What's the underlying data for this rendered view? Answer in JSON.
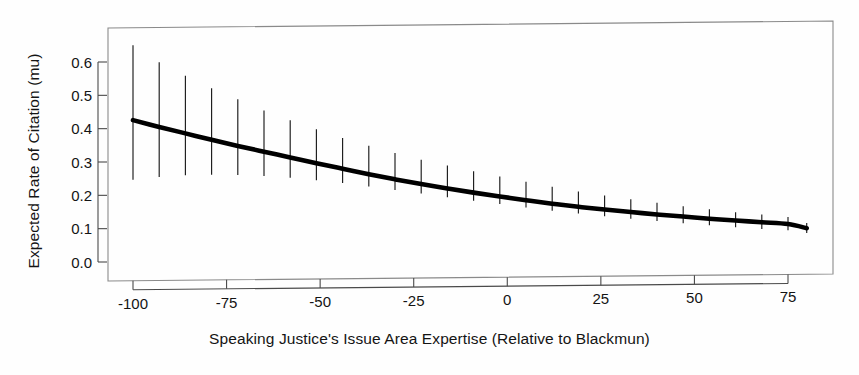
{
  "figure": {
    "background_color": "#fefefe",
    "line_color": "#000000",
    "errorbar_color": "#1a1a1a",
    "frame_color": "#8a8a8a"
  },
  "axis_titles": {
    "y": "Expected Rate of Citation (mu)",
    "x": "Speaking Justice's  Issue Area Expertise (Relative to Blackmun)"
  },
  "ticks": {
    "y_labels": [
      "0.0",
      "0.1",
      "0.2",
      "0.3",
      "0.4",
      "0.5",
      "0.6"
    ],
    "y_values": [
      0.0,
      0.1,
      0.2,
      0.3,
      0.4,
      0.5,
      0.6
    ],
    "x_labels": [
      "-100",
      "-75",
      "-50",
      "-25",
      "0",
      "25",
      "50",
      "75"
    ],
    "x_values": [
      -100,
      -75,
      -50,
      -25,
      0,
      25,
      50,
      75
    ]
  },
  "chart_data": {
    "type": "line",
    "title": "",
    "subtitle": "",
    "xlabel": "Speaking Justice's  Issue Area Expertise (Relative to Blackmun)",
    "ylabel": "Expected Rate of Citation (mu)",
    "xlim": [
      -103,
      83
    ],
    "ylim": [
      0.0,
      0.675
    ],
    "grid": false,
    "legend": "none",
    "series": [
      {
        "name": "Expected rate of citation (mu)",
        "x": [
          -100,
          -93,
          -86,
          -79,
          -72,
          -65,
          -58,
          -51,
          -44,
          -37,
          -30,
          -23,
          -16,
          -9,
          -2,
          5,
          12,
          19,
          26,
          33,
          40,
          47,
          54,
          61,
          68,
          75,
          80
        ],
        "values": [
          0.425,
          0.404,
          0.384,
          0.364,
          0.345,
          0.327,
          0.309,
          0.291,
          0.274,
          0.257,
          0.241,
          0.226,
          0.212,
          0.199,
          0.187,
          0.175,
          0.164,
          0.154,
          0.145,
          0.137,
          0.129,
          0.122,
          0.115,
          0.109,
          0.103,
          0.097,
          0.084
        ],
        "error_upper": [
          0.65,
          0.598,
          0.557,
          0.519,
          0.485,
          0.451,
          0.421,
          0.393,
          0.366,
          0.342,
          0.32,
          0.299,
          0.281,
          0.263,
          0.247,
          0.23,
          0.215,
          0.2,
          0.187,
          0.175,
          0.164,
          0.153,
          0.143,
          0.134,
          0.126,
          0.118,
          0.1
        ],
        "error_lower": [
          0.246,
          0.254,
          0.258,
          0.259,
          0.258,
          0.254,
          0.248,
          0.24,
          0.231,
          0.22,
          0.209,
          0.198,
          0.186,
          0.175,
          0.164,
          0.153,
          0.143,
          0.134,
          0.125,
          0.117,
          0.109,
          0.102,
          0.095,
          0.089,
          0.083,
          0.078,
          0.07
        ]
      }
    ],
    "annotations": []
  }
}
